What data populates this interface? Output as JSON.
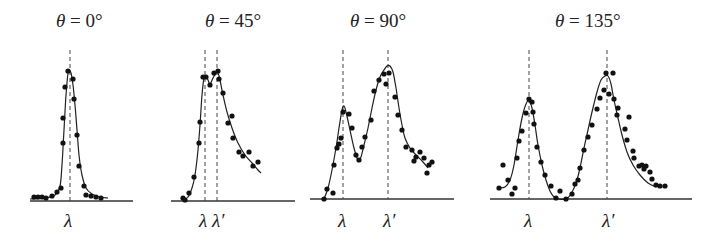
{
  "chart_data": [
    {
      "type": "scatter",
      "title": "θ = 0°",
      "title_parts": {
        "symbol": "θ",
        "rest": " = 0°"
      },
      "xlabel": "",
      "ylabel": "",
      "markers": [
        {
          "label": "λ",
          "x": 70
        }
      ],
      "axis": {
        "x1": 30,
        "x2": 133,
        "y": 201
      },
      "title_x": 56,
      "curve": [
        [
          30,
          199
        ],
        [
          45,
          198
        ],
        [
          55,
          195
        ],
        [
          60,
          186
        ],
        [
          62,
          165
        ],
        [
          64,
          130
        ],
        [
          66,
          95
        ],
        [
          68,
          73
        ],
        [
          69,
          70
        ],
        [
          71,
          73
        ],
        [
          73,
          85
        ],
        [
          75,
          105
        ],
        [
          77,
          130
        ],
        [
          79,
          155
        ],
        [
          82,
          175
        ],
        [
          86,
          188
        ],
        [
          92,
          194
        ],
        [
          100,
          197
        ],
        [
          108,
          198
        ]
      ],
      "points": [
        [
          34,
          197
        ],
        [
          38,
          197
        ],
        [
          42,
          197
        ],
        [
          46,
          198
        ],
        [
          52,
          196
        ],
        [
          57,
          192
        ],
        [
          61,
          188
        ],
        [
          63,
          143
        ],
        [
          63,
          118
        ],
        [
          65,
          87
        ],
        [
          68,
          71
        ],
        [
          73,
          79
        ],
        [
          74,
          99
        ],
        [
          77,
          135
        ],
        [
          79,
          166
        ],
        [
          84,
          186
        ],
        [
          86,
          195
        ],
        [
          91,
          196
        ],
        [
          96,
          197
        ],
        [
          101,
          198
        ]
      ]
    },
    {
      "type": "scatter",
      "title": "θ = 45°",
      "title_parts": {
        "symbol": "θ",
        "rest": " = 45°"
      },
      "xlabel": "",
      "ylabel": "",
      "markers": [
        {
          "label": "λ",
          "x": 205
        },
        {
          "label": "λ′",
          "x": 217
        }
      ],
      "axis": {
        "x1": 171,
        "x2": 295,
        "y": 201
      },
      "title_x": 205,
      "curve": [
        [
          183,
          200
        ],
        [
          188,
          197
        ],
        [
          192,
          188
        ],
        [
          195,
          175
        ],
        [
          198,
          150
        ],
        [
          200,
          125
        ],
        [
          202,
          95
        ],
        [
          204,
          78
        ],
        [
          206,
          76
        ],
        [
          208,
          80
        ],
        [
          210,
          84
        ],
        [
          213,
          78
        ],
        [
          216,
          73
        ],
        [
          218,
          73
        ],
        [
          220,
          80
        ],
        [
          223,
          95
        ],
        [
          227,
          112
        ],
        [
          232,
          128
        ],
        [
          238,
          143
        ],
        [
          245,
          155
        ],
        [
          252,
          163
        ],
        [
          258,
          170
        ],
        [
          261,
          173
        ]
      ],
      "points": [
        [
          183,
          198
        ],
        [
          185,
          200
        ],
        [
          189,
          193
        ],
        [
          194,
          177
        ],
        [
          199,
          143
        ],
        [
          200,
          122
        ],
        [
          203,
          77
        ],
        [
          206,
          77
        ],
        [
          210,
          85
        ],
        [
          214,
          73
        ],
        [
          218,
          71
        ],
        [
          219,
          79
        ],
        [
          223,
          93
        ],
        [
          228,
          123
        ],
        [
          232,
          116
        ],
        [
          233,
          138
        ],
        [
          239,
          152
        ],
        [
          243,
          156
        ],
        [
          249,
          152
        ],
        [
          253,
          166
        ],
        [
          258,
          162
        ]
      ]
    },
    {
      "type": "scatter",
      "title": "θ = 90°",
      "title_parts": {
        "symbol": "θ",
        "rest": " = 90°"
      },
      "xlabel": "",
      "ylabel": "",
      "markers": [
        {
          "label": "λ",
          "x": 343
        },
        {
          "label": "λ′",
          "x": 388
        }
      ],
      "axis": {
        "x1": 310,
        "x2": 454,
        "y": 199
      },
      "title_x": 350,
      "curve": [
        [
          324,
          199
        ],
        [
          328,
          188
        ],
        [
          332,
          170
        ],
        [
          336,
          148
        ],
        [
          339,
          128
        ],
        [
          342,
          110
        ],
        [
          344,
          106
        ],
        [
          346,
          112
        ],
        [
          350,
          130
        ],
        [
          354,
          148
        ],
        [
          358,
          160
        ],
        [
          361,
          157
        ],
        [
          364,
          145
        ],
        [
          368,
          128
        ],
        [
          372,
          108
        ],
        [
          376,
          90
        ],
        [
          380,
          77
        ],
        [
          384,
          70
        ],
        [
          387,
          66
        ],
        [
          390,
          66
        ],
        [
          393,
          72
        ],
        [
          396,
          88
        ],
        [
          399,
          108
        ],
        [
          402,
          125
        ],
        [
          405,
          138
        ],
        [
          410,
          148
        ],
        [
          416,
          155
        ],
        [
          423,
          162
        ],
        [
          428,
          168
        ]
      ],
      "points": [
        [
          324,
          199
        ],
        [
          327,
          189
        ],
        [
          333,
          193
        ],
        [
          334,
          165
        ],
        [
          337,
          148
        ],
        [
          339,
          144
        ],
        [
          341,
          138
        ],
        [
          343,
          112
        ],
        [
          349,
          114
        ],
        [
          352,
          128
        ],
        [
          356,
          155
        ],
        [
          359,
          160
        ],
        [
          362,
          147
        ],
        [
          365,
          137
        ],
        [
          371,
          120
        ],
        [
          374,
          91
        ],
        [
          379,
          80
        ],
        [
          384,
          74
        ],
        [
          386,
          84
        ],
        [
          389,
          73
        ],
        [
          395,
          97
        ],
        [
          398,
          115
        ],
        [
          402,
          130
        ],
        [
          406,
          147
        ],
        [
          412,
          150
        ],
        [
          414,
          161
        ],
        [
          416,
          157
        ],
        [
          420,
          152
        ],
        [
          424,
          158
        ],
        [
          429,
          165
        ],
        [
          427,
          173
        ],
        [
          432,
          162
        ]
      ]
    },
    {
      "type": "scatter",
      "title": "θ = 135°",
      "title_parts": {
        "symbol": "θ",
        "rest": " = 135°"
      },
      "xlabel": "",
      "ylabel": "",
      "markers": [
        {
          "label": "λ",
          "x": 529
        },
        {
          "label": "λ′",
          "x": 607
        }
      ],
      "axis": {
        "x1": 490,
        "x2": 692,
        "y": 199
      },
      "title_x": 555,
      "curve": [
        [
          499,
          188
        ],
        [
          505,
          187
        ],
        [
          510,
          180
        ],
        [
          514,
          165
        ],
        [
          518,
          140
        ],
        [
          522,
          118
        ],
        [
          526,
          104
        ],
        [
          529,
          101
        ],
        [
          532,
          108
        ],
        [
          535,
          125
        ],
        [
          538,
          145
        ],
        [
          542,
          165
        ],
        [
          546,
          180
        ],
        [
          550,
          191
        ],
        [
          554,
          197
        ],
        [
          559,
          199
        ],
        [
          566,
          199
        ],
        [
          571,
          194
        ],
        [
          576,
          183
        ],
        [
          580,
          168
        ],
        [
          584,
          148
        ],
        [
          588,
          130
        ],
        [
          592,
          112
        ],
        [
          597,
          92
        ],
        [
          601,
          80
        ],
        [
          605,
          76
        ],
        [
          608,
          76
        ],
        [
          611,
          84
        ],
        [
          614,
          100
        ],
        [
          618,
          118
        ],
        [
          622,
          135
        ],
        [
          627,
          152
        ],
        [
          633,
          165
        ],
        [
          640,
          175
        ],
        [
          648,
          183
        ],
        [
          656,
          187
        ]
      ],
      "points": [
        [
          499,
          188
        ],
        [
          503,
          165
        ],
        [
          508,
          180
        ],
        [
          512,
          194
        ],
        [
          515,
          188
        ],
        [
          517,
          158
        ],
        [
          519,
          141
        ],
        [
          522,
          131
        ],
        [
          526,
          113
        ],
        [
          529,
          99
        ],
        [
          532,
          102
        ],
        [
          533,
          112
        ],
        [
          534,
          124
        ],
        [
          537,
          147
        ],
        [
          541,
          162
        ],
        [
          545,
          175
        ],
        [
          551,
          186
        ],
        [
          556,
          198
        ],
        [
          560,
          191
        ],
        [
          566,
          199
        ],
        [
          572,
          194
        ],
        [
          575,
          184
        ],
        [
          578,
          180
        ],
        [
          580,
          168
        ],
        [
          584,
          150
        ],
        [
          588,
          137
        ],
        [
          592,
          125
        ],
        [
          597,
          109
        ],
        [
          600,
          98
        ],
        [
          604,
          90
        ],
        [
          606,
          73
        ],
        [
          609,
          94
        ],
        [
          613,
          73
        ],
        [
          614,
          99
        ],
        [
          617,
          115
        ],
        [
          618,
          108
        ],
        [
          629,
          117
        ],
        [
          625,
          129
        ],
        [
          627,
          140
        ],
        [
          633,
          151
        ],
        [
          634,
          158
        ],
        [
          639,
          166
        ],
        [
          642,
          165
        ],
        [
          644,
          169
        ],
        [
          646,
          166
        ],
        [
          650,
          172
        ],
        [
          652,
          179
        ],
        [
          656,
          185
        ],
        [
          660,
          186
        ],
        [
          665,
          186
        ]
      ]
    }
  ]
}
